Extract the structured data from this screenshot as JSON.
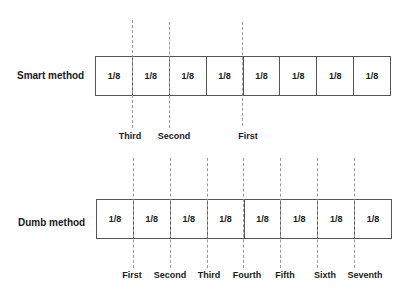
{
  "smart": {
    "label": "Smart method",
    "cells": [
      "1/8",
      "1/8",
      "1/8",
      "1/8",
      "1/8",
      "1/8",
      "1/8",
      "1/8"
    ],
    "cuts": [
      {
        "label": "Third",
        "boundary": 1
      },
      {
        "label": "Second",
        "boundary": 2
      },
      {
        "label": "First",
        "boundary": 4
      }
    ]
  },
  "dumb": {
    "label": "Dumb method",
    "cells": [
      "1/8",
      "1/8",
      "1/8",
      "1/8",
      "1/8",
      "1/8",
      "1/8",
      "1/8"
    ],
    "cuts": [
      {
        "label": "First",
        "boundary": 1
      },
      {
        "label": "Second",
        "boundary": 2
      },
      {
        "label": "Third",
        "boundary": 3
      },
      {
        "label": "Fourth",
        "boundary": 4
      },
      {
        "label": "Fifth",
        "boundary": 5
      },
      {
        "label": "Sixth",
        "boundary": 6
      },
      {
        "label": "Seventh",
        "boundary": 7
      }
    ]
  }
}
